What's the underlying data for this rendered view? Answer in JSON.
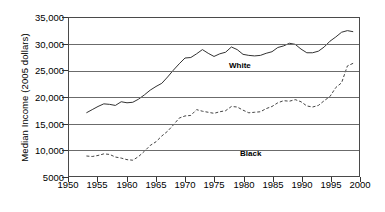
{
  "chart_data": {
    "type": "line",
    "title": "",
    "xlabel": "",
    "ylabel": "Median Income (2005 dollars)",
    "xlim": [
      1950,
      2000
    ],
    "ylim": [
      5000,
      35000
    ],
    "grid": true,
    "legend_position": "inline-annotation",
    "xticks": [
      "1950",
      "1955",
      "1960",
      "1965",
      "1970",
      "1975",
      "1980",
      "1985",
      "1990",
      "1995",
      "2000"
    ],
    "yticks": [
      "5000",
      "10,000",
      "15,000",
      "20,000",
      "25,000",
      "30,000",
      "35,000"
    ],
    "ytick_values": [
      5000,
      10000,
      15000,
      20000,
      25000,
      30000,
      35000
    ],
    "xtick_values": [
      1950,
      1955,
      1960,
      1965,
      1970,
      1975,
      1980,
      1985,
      1990,
      1995,
      2000
    ],
    "series": [
      {
        "name": "White",
        "style": "solid",
        "color": "#333333",
        "label_x": 1968,
        "label_y": 30500,
        "x": [
          1953,
          1954,
          1955,
          1956,
          1957,
          1958,
          1959,
          1960,
          1961,
          1962,
          1963,
          1964,
          1965,
          1966,
          1967,
          1968,
          1969,
          1970,
          1971,
          1972,
          1973,
          1974,
          1975,
          1976,
          1977,
          1978,
          1979,
          1980,
          1981,
          1982,
          1983,
          1984,
          1985,
          1986,
          1987,
          1988,
          1989,
          1990,
          1991,
          1992,
          1993,
          1994,
          1995,
          1996,
          1997,
          1998,
          1999
        ],
        "values": [
          17000,
          17600,
          18200,
          18700,
          18600,
          18400,
          19100,
          18900,
          19000,
          19600,
          20400,
          21300,
          22000,
          22600,
          23800,
          25100,
          26300,
          27400,
          27500,
          28200,
          29000,
          28300,
          27700,
          28200,
          28500,
          29500,
          29000,
          28100,
          27900,
          27800,
          27900,
          28300,
          28600,
          29400,
          29700,
          30200,
          30000,
          29100,
          28400,
          28400,
          28700,
          29500,
          30600,
          31400,
          32300,
          32600,
          32400
        ]
      },
      {
        "name": "Black",
        "style": "dashed",
        "color": "#444444",
        "label_x": 1967,
        "label_y": 13500,
        "x": [
          1953,
          1954,
          1955,
          1956,
          1957,
          1958,
          1959,
          1960,
          1961,
          1962,
          1963,
          1964,
          1965,
          1966,
          1967,
          1968,
          1969,
          1970,
          1971,
          1972,
          1973,
          1974,
          1975,
          1976,
          1977,
          1978,
          1979,
          1980,
          1981,
          1982,
          1983,
          1984,
          1985,
          1986,
          1987,
          1988,
          1989,
          1990,
          1991,
          1992,
          1993,
          1994,
          1995,
          1996,
          1997,
          1998,
          1999
        ],
        "values": [
          8800,
          8700,
          8900,
          9200,
          9100,
          8600,
          8400,
          8100,
          8000,
          8700,
          9700,
          10800,
          11500,
          12600,
          13500,
          14700,
          16000,
          16400,
          16500,
          17600,
          17300,
          17100,
          16900,
          17200,
          17400,
          18200,
          18100,
          17500,
          17000,
          17100,
          17200,
          17800,
          18200,
          18900,
          19300,
          19200,
          19500,
          19100,
          18300,
          18100,
          18400,
          19300,
          20100,
          21800,
          22700,
          25900,
          26400
        ]
      }
    ]
  },
  "axis": {
    "y_title": "Median Income (2005 dollars)"
  },
  "annotations": {
    "white_label": "White",
    "black_label": "Black"
  }
}
